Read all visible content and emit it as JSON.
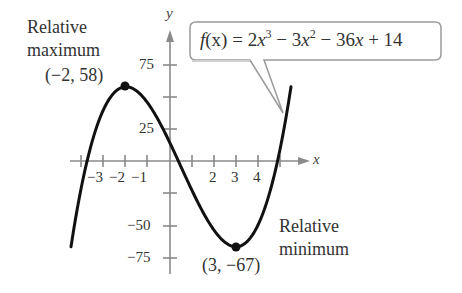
{
  "chart_data": {
    "type": "line",
    "title": "",
    "function": "f(x) = 2x^3 - 3x^2 - 36x + 14",
    "xlabel": "x",
    "ylabel": "y",
    "xlim": [
      -4.5,
      5.5
    ],
    "ylim": [
      -80,
      95
    ],
    "x_ticks": [
      -4,
      -3,
      -2,
      -1,
      1,
      2,
      3,
      4,
      5
    ],
    "x_tick_labels": [
      "-3",
      "-2",
      "-1",
      "2",
      "3",
      "4"
    ],
    "y_ticks": [
      75,
      50,
      25,
      -25,
      -50,
      -75
    ],
    "y_tick_labels": [
      "75",
      "25",
      "-50",
      "-75"
    ],
    "grid": false,
    "series": [
      {
        "name": "f(x)",
        "x": [
          -4.5,
          -4,
          -3.5,
          -3,
          -2.5,
          -2,
          -1.5,
          -1,
          -0.5,
          0,
          0.5,
          1,
          1.5,
          2,
          2.5,
          3,
          3.5,
          4,
          4.5,
          5,
          5.5
        ],
        "values": [
          -67,
          -18,
          19.5,
          41,
          53.5,
          58,
          54.5,
          45,
          31.5,
          14,
          -5.5,
          -23,
          -38.5,
          -50,
          -56,
          -67,
          -55.5,
          -50,
          -35,
          -11,
          58
        ]
      }
    ],
    "annotations": [
      {
        "label": "Relative maximum",
        "point": [
          -2,
          58
        ],
        "point_label": "(−2, 58)"
      },
      {
        "label": "Relative minimum",
        "point": [
          3,
          -67
        ],
        "point_label": "(3, −67)"
      }
    ]
  },
  "labels": {
    "rel_max_line1": "Relative",
    "rel_max_line2": "maximum",
    "rel_max_point": "(−2, 58)",
    "rel_min_line1": "Relative",
    "rel_min_line2": "minimum",
    "rel_min_point": "(3, −67)",
    "x_axis": "x",
    "y_axis": "y"
  },
  "ticks": {
    "x": [
      "−3",
      "−2",
      "−1",
      "2",
      "3",
      "4"
    ],
    "y": [
      "75",
      "25",
      "−50",
      "−75"
    ]
  },
  "callout": {
    "f": "f",
    "x1": "(x)",
    "eq": " = 2",
    "x2": "x",
    "exp1": "3",
    "minus1": " − 3",
    "x3": "x",
    "exp2": "2",
    "minus2": " − 36",
    "x4": "x",
    "tail": " + 14"
  },
  "colors": {
    "curve": "#111111",
    "axis": "#8a8a8a",
    "text": "#333333",
    "callout_border": "#999999"
  }
}
